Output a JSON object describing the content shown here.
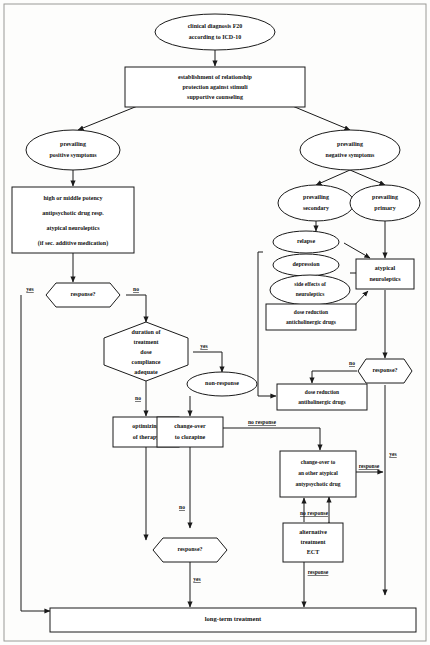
{
  "diagram": {
    "stroke_color": "#1a1a1a",
    "fill_color": "#ffffff",
    "background": "#fdfdfc"
  },
  "nodes": {
    "start": {
      "shape": "ellipse",
      "lines": [
        "clinical diagnosis F20",
        "according to ICD-10"
      ]
    },
    "establishment": {
      "shape": "box",
      "lines": [
        "establishment of relationship",
        "protection against stimuli",
        "supportive counseling"
      ]
    },
    "positive_symptoms": {
      "shape": "ellipse",
      "lines": [
        "prevailing",
        "positive symptoms"
      ]
    },
    "negative_symptoms": {
      "shape": "ellipse",
      "lines": [
        "prevailing",
        "negative symptoms"
      ]
    },
    "high_potency": {
      "shape": "box",
      "lines": [
        "high or middle potency",
        "antipsychotic drug resp.",
        "atypical neuroleptics",
        "(if sec. additive medication)"
      ]
    },
    "response_1": {
      "shape": "hexagon",
      "lines": [
        "response?"
      ]
    },
    "duration": {
      "shape": "hexagon",
      "lines": [
        "duration of",
        "treatment",
        "dose",
        "compliance",
        "adequate"
      ]
    },
    "non_response": {
      "shape": "ellipse",
      "lines": [
        "non-response"
      ]
    },
    "optimizing": {
      "shape": "box",
      "lines": [
        "optimizing",
        "of therapy"
      ]
    },
    "clozapine": {
      "shape": "box",
      "lines": [
        "change-over",
        "to clozapine"
      ]
    },
    "response_bottom": {
      "shape": "hexagon",
      "lines": [
        "response?"
      ]
    },
    "prevailing_secondary": {
      "shape": "ellipse",
      "lines": [
        "prevailing",
        "secondary"
      ]
    },
    "prevailing_primary": {
      "shape": "ellipse",
      "lines": [
        "prevailing",
        "primary"
      ]
    },
    "relapse": {
      "shape": "ellipse",
      "lines": [
        "relapse"
      ]
    },
    "depression": {
      "shape": "ellipse",
      "lines": [
        "depression"
      ]
    },
    "side_effects": {
      "shape": "ellipse",
      "lines": [
        "side effects of",
        "neuroleptics"
      ]
    },
    "atypical_neuroleptics": {
      "shape": "box",
      "lines": [
        "atypical",
        "neuroleptics"
      ]
    },
    "dose_reduction_anticholinergic_1": {
      "shape": "box",
      "lines": [
        "dose reduction",
        "anticholinergic drugs"
      ]
    },
    "dose_reduction_anticholinergic_2": {
      "shape": "box",
      "lines": [
        "dose reduction",
        "antiholinergic drugs"
      ]
    },
    "response_2": {
      "shape": "hexagon",
      "lines": [
        "response?"
      ]
    },
    "changeover_atypical": {
      "shape": "box",
      "lines": [
        "change-over to",
        "an other atypical",
        "antypsychotic drug"
      ]
    },
    "alternative_ect": {
      "shape": "box",
      "lines": [
        "alternative",
        "treatment",
        "ECT"
      ]
    },
    "long_term": {
      "shape": "box",
      "lines": [
        "long-term treatment"
      ]
    }
  },
  "edge_labels": {
    "yes_1": "yes",
    "no_1": "no",
    "yes_duration": "yes",
    "no_duration": "no",
    "no_optimizing": "no",
    "no_clozapine": "no response",
    "yes_bottom": "yes",
    "no_response_2": "no",
    "yes_right": "yes",
    "no_response_changeover": "no response",
    "no_response_ect": "no response",
    "response_changeover": "response",
    "response_ect": "response"
  }
}
